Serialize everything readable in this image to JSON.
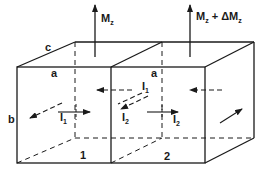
{
  "diagram": {
    "colors": {
      "line": "#1a1a1a",
      "background": "#ffffff"
    },
    "moments": [
      {
        "id": "cell-1-moment",
        "label_main": "M",
        "label_sub": "z",
        "label_extra": ""
      },
      {
        "id": "cell-2-moment",
        "label_main": "M",
        "label_sub": "z",
        "label_extra": " + ΔM",
        "label_extra_sub": "z"
      }
    ],
    "dimensions": {
      "a": "a",
      "a2": "a",
      "b": "b",
      "c": "c"
    },
    "cells": [
      {
        "number": "1"
      },
      {
        "number": "2"
      }
    ],
    "currents": [
      {
        "main": "I",
        "sub": "1"
      },
      {
        "main": "I",
        "sub": "1"
      },
      {
        "main": "I",
        "sub": "2"
      },
      {
        "main": "I",
        "sub": "2"
      }
    ]
  }
}
